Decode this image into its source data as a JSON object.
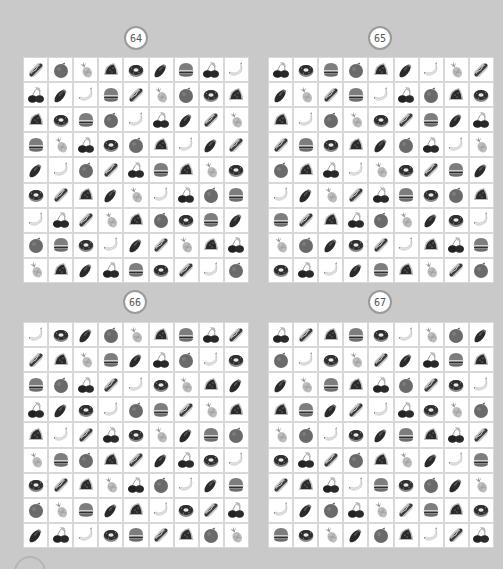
{
  "legend": {
    "H": "hotdog",
    "O": "orange",
    "P": "pineapple",
    "W": "watermelon",
    "D": "donut",
    "E": "eggplant",
    "B": "burger",
    "C": "cherries",
    "N": "banana"
  },
  "puzzles": [
    {
      "number": "64",
      "grid": [
        [
          "H",
          "O",
          "P",
          "W",
          "D",
          "E",
          "B",
          "C",
          "N"
        ],
        [
          "C",
          "E",
          "N",
          "B",
          "H",
          "P",
          "O",
          "D",
          "W"
        ],
        [
          "W",
          "D",
          "B",
          "O",
          "N",
          "C",
          "E",
          "H",
          "P"
        ],
        [
          "B",
          "P",
          "C",
          "D",
          "O",
          "W",
          "N",
          "E",
          "H"
        ],
        [
          "E",
          "N",
          "O",
          "H",
          "C",
          "B",
          "W",
          "P",
          "D"
        ],
        [
          "D",
          "H",
          "W",
          "E",
          "P",
          "N",
          "C",
          "O",
          "B"
        ],
        [
          "N",
          "C",
          "H",
          "P",
          "W",
          "O",
          "D",
          "B",
          "E"
        ],
        [
          "O",
          "B",
          "D",
          "N",
          "E",
          "H",
          "P",
          "W",
          "C"
        ],
        [
          "P",
          "W",
          "E",
          "C",
          "B",
          "D",
          "H",
          "N",
          "O"
        ]
      ]
    },
    {
      "number": "65",
      "grid": [
        [
          "C",
          "D",
          "B",
          "O",
          "W",
          "E",
          "N",
          "P",
          "H"
        ],
        [
          "E",
          "P",
          "H",
          "B",
          "N",
          "C",
          "O",
          "W",
          "D"
        ],
        [
          "W",
          "N",
          "O",
          "P",
          "D",
          "H",
          "B",
          "E",
          "C"
        ],
        [
          "H",
          "B",
          "D",
          "W",
          "E",
          "O",
          "C",
          "N",
          "P"
        ],
        [
          "O",
          "W",
          "C",
          "N",
          "P",
          "D",
          "H",
          "B",
          "E"
        ],
        [
          "N",
          "E",
          "P",
          "H",
          "C",
          "B",
          "D",
          "O",
          "W"
        ],
        [
          "B",
          "H",
          "W",
          "C",
          "O",
          "P",
          "E",
          "D",
          "N"
        ],
        [
          "P",
          "O",
          "E",
          "D",
          "H",
          "N",
          "W",
          "C",
          "B"
        ],
        [
          "D",
          "C",
          "N",
          "E",
          "B",
          "W",
          "P",
          "H",
          "O"
        ]
      ]
    },
    {
      "number": "66",
      "grid": [
        [
          "N",
          "D",
          "E",
          "O",
          "P",
          "W",
          "B",
          "C",
          "H"
        ],
        [
          "H",
          "W",
          "P",
          "B",
          "E",
          "C",
          "O",
          "N",
          "D"
        ],
        [
          "B",
          "O",
          "C",
          "H",
          "N",
          "D",
          "P",
          "W",
          "E"
        ],
        [
          "C",
          "E",
          "D",
          "N",
          "O",
          "B",
          "H",
          "P",
          "W"
        ],
        [
          "W",
          "N",
          "H",
          "C",
          "D",
          "P",
          "E",
          "B",
          "O"
        ],
        [
          "P",
          "B",
          "O",
          "W",
          "H",
          "E",
          "C",
          "D",
          "N"
        ],
        [
          "D",
          "H",
          "W",
          "P",
          "C",
          "O",
          "N",
          "E",
          "B"
        ],
        [
          "O",
          "P",
          "B",
          "E",
          "W",
          "N",
          "D",
          "H",
          "C"
        ],
        [
          "E",
          "C",
          "N",
          "D",
          "B",
          "H",
          "W",
          "O",
          "P"
        ]
      ]
    },
    {
      "number": "67",
      "grid": [
        [
          "C",
          "H",
          "W",
          "B",
          "D",
          "N",
          "P",
          "O",
          "E"
        ],
        [
          "O",
          "N",
          "D",
          "P",
          "H",
          "E",
          "C",
          "B",
          "W"
        ],
        [
          "E",
          "P",
          "B",
          "W",
          "C",
          "O",
          "H",
          "D",
          "N"
        ],
        [
          "W",
          "B",
          "E",
          "H",
          "N",
          "C",
          "D",
          "P",
          "O"
        ],
        [
          "P",
          "O",
          "N",
          "D",
          "E",
          "B",
          "W",
          "C",
          "H"
        ],
        [
          "D",
          "C",
          "H",
          "O",
          "W",
          "P",
          "E",
          "N",
          "B"
        ],
        [
          "H",
          "W",
          "C",
          "N",
          "B",
          "D",
          "O",
          "E",
          "P"
        ],
        [
          "N",
          "E",
          "O",
          "C",
          "P",
          "H",
          "B",
          "W",
          "D"
        ],
        [
          "B",
          "D",
          "P",
          "E",
          "O",
          "W",
          "N",
          "H",
          "C"
        ]
      ]
    }
  ],
  "colors": {
    "background": "#c9c9c9",
    "cell": "#ffffff",
    "gridline": "#d8d8d8",
    "badge_border": "#9a9a9a"
  }
}
